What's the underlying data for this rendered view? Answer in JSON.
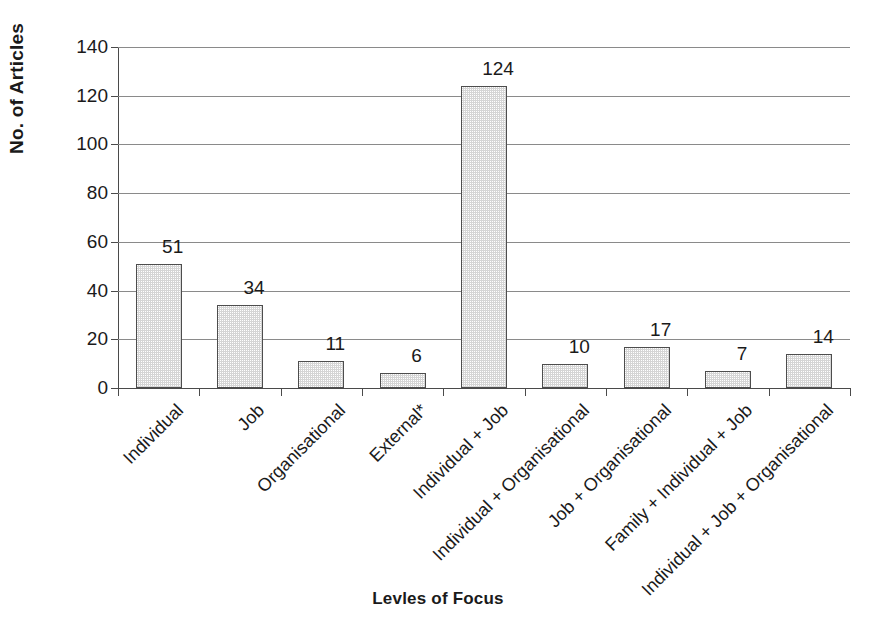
{
  "chart_data": {
    "type": "bar",
    "title": "",
    "xlabel": "Levles of Focus",
    "ylabel": "No. of Articles",
    "ylim": [
      0,
      140
    ],
    "ytick_interval": 20,
    "yticks": [
      0,
      20,
      40,
      60,
      80,
      100,
      120,
      140
    ],
    "grid": true,
    "legend": "none",
    "orientation": "vertical",
    "bar_fill_color": "#d5d5d5",
    "bar_border_color": "#4d4d4d",
    "axis_color": "#4a4a4a",
    "gridline_color": "#8a8a8a",
    "text_color": "#1a1a1a",
    "xtick_label_rotation": -45,
    "categories": [
      "Individual",
      "Job",
      "Organisational",
      "External*",
      "Individual + Job",
      "Individual + Organisational",
      "Job + Organisational",
      "Family + Individual + Job",
      "Individual + Job + Organisational"
    ],
    "values": [
      51,
      34,
      11,
      6,
      124,
      10,
      17,
      7,
      14
    ],
    "data_labels": [
      "51",
      "34",
      "11",
      "6",
      "124",
      "10",
      "17",
      "7",
      "14"
    ]
  },
  "axis": {
    "y_title": "No. of Articles",
    "x_title": "Levles of Focus",
    "y_tick_labels": [
      "140",
      "120",
      "100",
      "80",
      "60",
      "40",
      "20",
      "0"
    ]
  }
}
